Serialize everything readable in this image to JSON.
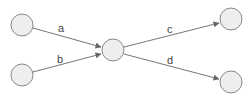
{
  "diagram": {
    "type": "directed-graph",
    "nodes": [
      {
        "id": "n1",
        "cx": 22,
        "cy": 25,
        "r": 11
      },
      {
        "id": "n2",
        "cx": 22,
        "cy": 75,
        "r": 11
      },
      {
        "id": "hub",
        "cx": 113,
        "cy": 50,
        "r": 11
      },
      {
        "id": "n4",
        "cx": 231,
        "cy": 19,
        "r": 11
      },
      {
        "id": "n5",
        "cx": 231,
        "cy": 82,
        "r": 11
      }
    ],
    "edges": [
      {
        "from": "n1",
        "to": "hub",
        "label": "a"
      },
      {
        "from": "n2",
        "to": "hub",
        "label": "b"
      },
      {
        "from": "hub",
        "to": "n4",
        "label": "c"
      },
      {
        "from": "hub",
        "to": "n5",
        "label": "d"
      }
    ]
  }
}
